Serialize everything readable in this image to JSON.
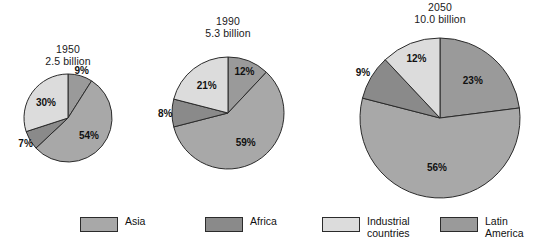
{
  "chart_data": {
    "type": "pie",
    "title": "",
    "legend_position": "bottom",
    "categories": [
      "Asia",
      "Africa",
      "Industrial countries",
      "Latin America"
    ],
    "colors": {
      "asia": "#a8a8a8",
      "africa": "#8a8a8a",
      "industrial_countries": "#dcdcdc",
      "latin_america": "#9a9a9a",
      "outline": "#2b2b2b"
    },
    "charts": [
      {
        "id": "pie-1950",
        "year": "1950",
        "total": "2.5 billion",
        "radius_px": 44,
        "slices": [
          {
            "category": "Latin America",
            "label": "9%",
            "value": 9,
            "color_key": "latin_america"
          },
          {
            "category": "Asia",
            "label": "54%",
            "value": 54,
            "color_key": "asia"
          },
          {
            "category": "Africa",
            "label": "7%",
            "value": 7,
            "color_key": "africa"
          },
          {
            "category": "Industrial countries",
            "label": "30%",
            "value": 30,
            "color_key": "industrial_countries"
          }
        ]
      },
      {
        "id": "pie-1990",
        "year": "1990",
        "total": "5.3 billion",
        "radius_px": 56,
        "slices": [
          {
            "category": "Latin America",
            "label": "12%",
            "value": 12,
            "color_key": "latin_america"
          },
          {
            "category": "Asia",
            "label": "59%",
            "value": 59,
            "color_key": "asia"
          },
          {
            "category": "Africa",
            "label": "8%",
            "value": 8,
            "color_key": "africa"
          },
          {
            "category": "Industrial countries",
            "label": "21%",
            "value": 21,
            "color_key": "industrial_countries"
          }
        ]
      },
      {
        "id": "pie-2050",
        "year": "2050",
        "total": "10.0 billion",
        "radius_px": 80,
        "slices": [
          {
            "category": "Latin America",
            "label": "23%",
            "value": 23,
            "color_key": "latin_america"
          },
          {
            "category": "Asia",
            "label": "56%",
            "value": 56,
            "color_key": "asia"
          },
          {
            "category": "Africa",
            "label": "9%",
            "value": 9,
            "color_key": "africa"
          },
          {
            "category": "Industrial countries",
            "label": "12%",
            "value": 12,
            "color_key": "industrial_countries"
          }
        ]
      }
    ],
    "legend": [
      {
        "label": "Asia",
        "color_key": "asia"
      },
      {
        "label": "Africa",
        "color_key": "africa"
      },
      {
        "label": "Industrial\ncountries",
        "color_key": "industrial_countries"
      },
      {
        "label": "Latin\nAmerica",
        "color_key": "latin_america"
      }
    ]
  },
  "layout": {
    "pies": [
      {
        "cx": 68,
        "cy": 118,
        "title_cx": 68,
        "title_top": 44
      },
      {
        "cx": 228,
        "cy": 113,
        "title_cx": 228,
        "title_top": 16
      },
      {
        "cx": 440,
        "cy": 118,
        "title_cx": 440,
        "title_top": 2
      }
    ],
    "legend_item_offsets": [
      0,
      125,
      242,
      360
    ]
  }
}
